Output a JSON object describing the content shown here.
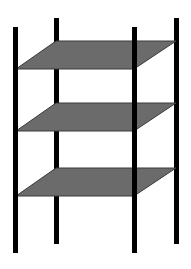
{
  "diagram": {
    "colors": {
      "background": "#ffffff",
      "pole": "#000000",
      "shelf_fill": "#6b6b6b",
      "shelf_stroke": "#3a3a3a"
    },
    "shelf_count": 3,
    "pole_count": 4
  }
}
